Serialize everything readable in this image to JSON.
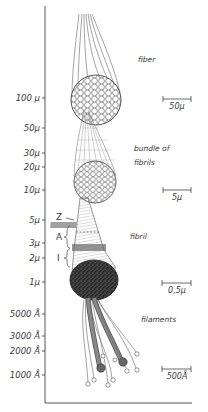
{
  "figure": {
    "type": "diagram",
    "axis": {
      "orientation": "vertical",
      "scale": "logarithmic size",
      "ticks": [
        {
          "label": "100 μ",
          "y": 98
        },
        {
          "label": "50μ",
          "y": 128
        },
        {
          "label": "30μ",
          "y": 153
        },
        {
          "label": "20μ",
          "y": 167
        },
        {
          "label": "10μ",
          "y": 190
        },
        {
          "label": "5μ",
          "y": 220
        },
        {
          "label": "3μ",
          "y": 243
        },
        {
          "label": "2μ",
          "y": 258
        },
        {
          "label": "1μ",
          "y": 282
        },
        {
          "label": "5000 Å",
          "y": 314
        },
        {
          "label": "3000 Å",
          "y": 336
        },
        {
          "label": "2000 Å",
          "y": 351
        },
        {
          "label": "1000 Å",
          "y": 375
        }
      ]
    },
    "levels": [
      {
        "name": "fiber",
        "label_y": 58,
        "scale_bar": "50μ",
        "scale_bar_y": 99
      },
      {
        "name": "bundle of fibrils",
        "line1": "bundle of",
        "line2": "fibrils",
        "label_y": 146,
        "scale_bar": "5μ",
        "scale_bar_y": 190
      },
      {
        "name": "fibril",
        "label_y": 233,
        "scale_bar": "0,5μ",
        "scale_bar_y": 283
      },
      {
        "name": "filaments",
        "label_y": 318,
        "scale_bar": "500Å",
        "scale_bar_y": 373
      }
    ],
    "band_labels": {
      "z": "Z",
      "a": "A",
      "i": "I"
    }
  }
}
